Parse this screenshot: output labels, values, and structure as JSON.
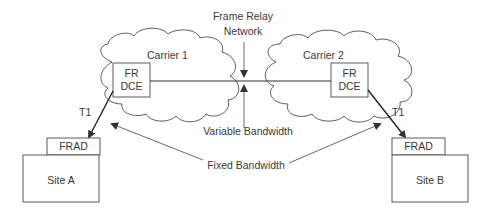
{
  "diagram": {
    "title_label": {
      "line1": "Frame Relay",
      "line2": "Network"
    },
    "clouds": [
      {
        "id": "carrier-1",
        "label": "Carrier 1"
      },
      {
        "id": "carrier-2",
        "label": "Carrier 2"
      }
    ],
    "devices": {
      "fr_dce_left": {
        "line1": "FR",
        "line2": "DCE"
      },
      "fr_dce_right": {
        "line1": "FR",
        "line2": "DCE"
      },
      "frad_left": "FRAD",
      "frad_right": "FRAD"
    },
    "sites": [
      {
        "id": "site-a",
        "label": "Site A"
      },
      {
        "id": "site-b",
        "label": "Site B"
      }
    ],
    "links": {
      "t1_left": "T1",
      "t1_right": "T1"
    },
    "annotations": {
      "variable_bandwidth": "Variable Bandwidth",
      "fixed_bandwidth": "Fixed Bandwidth"
    },
    "colors": {
      "stroke": "#3a3a3a",
      "background": "#ffffff"
    }
  }
}
